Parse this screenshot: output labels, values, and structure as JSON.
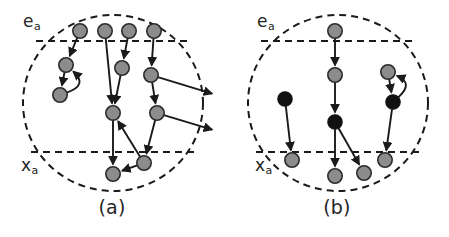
{
  "figure": {
    "title": "",
    "background_color": "#ffffff",
    "width": 449,
    "height": 237
  },
  "style": {
    "node_gray_fill": "#8c8c8c",
    "node_gray_stroke": "#2b2b2b",
    "node_black_fill": "#111111",
    "node_black_stroke": "#111111",
    "edge_color": "#1a1a1a",
    "boundary_color": "#1a1a1a",
    "band_color": "#1a1a1a",
    "text_color": "#252525",
    "node_radius": 7.2,
    "edge_width": 1.9,
    "boundary_dash": "7,5",
    "band_dash": "7,5"
  },
  "panels": [
    {
      "id": "a",
      "caption": "(a)",
      "top_label": "e",
      "top_label_sub": "a",
      "bottom_label": "x",
      "bottom_label_sub": "a",
      "boundary": {
        "cx": 113,
        "cy": 103,
        "rx": 90,
        "ry": 88
      },
      "bands": [
        {
          "name": "upper-band-line",
          "y": 41,
          "x1": 36,
          "x2": 191
        },
        {
          "name": "lower-band-line",
          "y": 152,
          "x1": 31,
          "x2": 196
        }
      ],
      "nodes": [
        {
          "id": "a1",
          "x": 80,
          "y": 31,
          "color": "gray"
        },
        {
          "id": "a2",
          "x": 105,
          "y": 31,
          "color": "gray"
        },
        {
          "id": "a3",
          "x": 129,
          "y": 31,
          "color": "gray"
        },
        {
          "id": "a4",
          "x": 154,
          "y": 31,
          "color": "gray"
        },
        {
          "id": "a5",
          "x": 66,
          "y": 65,
          "color": "gray"
        },
        {
          "id": "a6",
          "x": 122,
          "y": 68,
          "color": "gray"
        },
        {
          "id": "a7",
          "x": 151,
          "y": 75,
          "color": "gray"
        },
        {
          "id": "a8",
          "x": 60,
          "y": 95,
          "color": "gray"
        },
        {
          "id": "a9",
          "x": 113,
          "y": 113,
          "color": "gray"
        },
        {
          "id": "a10",
          "x": 157,
          "y": 113,
          "color": "gray"
        },
        {
          "id": "a11",
          "x": 144,
          "y": 163,
          "color": "gray"
        },
        {
          "id": "a12",
          "x": 113,
          "y": 174,
          "color": "gray"
        }
      ],
      "edges": [
        {
          "from": "a1",
          "to": "a5",
          "kind": "straight"
        },
        {
          "from": "a2",
          "to": "a9",
          "kind": "straight"
        },
        {
          "from": "a3",
          "to": "a6",
          "kind": "straight"
        },
        {
          "from": "a4",
          "to": "a7",
          "kind": "straight"
        },
        {
          "from": "a5",
          "to": "a8",
          "kind": "straight"
        },
        {
          "from": "a8",
          "to": "a5",
          "kind": "curved",
          "bow": 26
        },
        {
          "from": "a6",
          "to": "a9",
          "kind": "straight"
        },
        {
          "from": "a7",
          "to": "a10",
          "kind": "straight"
        },
        {
          "from": "a7",
          "to": "exit1",
          "kind": "exit"
        },
        {
          "from": "a10",
          "to": "exit2",
          "kind": "exit"
        },
        {
          "from": "a9",
          "to": "a12",
          "kind": "straight"
        },
        {
          "from": "a10",
          "to": "a11",
          "kind": "straight"
        },
        {
          "from": "a11",
          "to": "a9",
          "kind": "straight"
        },
        {
          "from": "a11",
          "to": "a12",
          "kind": "straight"
        }
      ],
      "exits": [
        {
          "id": "exit1",
          "x": 213,
          "y": 94
        },
        {
          "id": "exit2",
          "x": 213,
          "y": 130
        }
      ]
    },
    {
      "id": "b",
      "caption": "(b)",
      "top_label": "e",
      "top_label_sub": "a",
      "bottom_label": "x",
      "bottom_label_sub": "a",
      "boundary": {
        "cx": 113,
        "cy": 103,
        "rx": 90,
        "ry": 88
      },
      "bands": [
        {
          "name": "upper-band-line",
          "y": 41,
          "x1": 36,
          "x2": 191
        },
        {
          "name": "lower-band-line",
          "y": 152,
          "x1": 31,
          "x2": 196
        }
      ],
      "nodes": [
        {
          "id": "b1",
          "x": 110,
          "y": 31,
          "color": "gray"
        },
        {
          "id": "b2",
          "x": 110,
          "y": 75,
          "color": "gray"
        },
        {
          "id": "b3",
          "x": 163,
          "y": 72,
          "color": "gray"
        },
        {
          "id": "b4",
          "x": 60,
          "y": 99,
          "color": "black"
        },
        {
          "id": "b5",
          "x": 110,
          "y": 122,
          "color": "black"
        },
        {
          "id": "b6",
          "x": 168,
          "y": 102,
          "color": "black"
        },
        {
          "id": "b7",
          "x": 67,
          "y": 160,
          "color": "gray"
        },
        {
          "id": "b8",
          "x": 110,
          "y": 176,
          "color": "gray"
        },
        {
          "id": "b9",
          "x": 139,
          "y": 173,
          "color": "gray"
        },
        {
          "id": "b10",
          "x": 160,
          "y": 160,
          "color": "gray"
        }
      ],
      "edges": [
        {
          "from": "b1",
          "to": "b2",
          "kind": "straight"
        },
        {
          "from": "b2",
          "to": "b5",
          "kind": "straight"
        },
        {
          "from": "b3",
          "to": "b6",
          "kind": "straight"
        },
        {
          "from": "b6",
          "to": "b3",
          "kind": "curved",
          "bow": 24
        },
        {
          "from": "b4",
          "to": "b7",
          "kind": "straight"
        },
        {
          "from": "b5",
          "to": "b8",
          "kind": "straight"
        },
        {
          "from": "b5",
          "to": "b9",
          "kind": "straight"
        },
        {
          "from": "b6",
          "to": "b10",
          "kind": "straight"
        }
      ],
      "exits": []
    }
  ]
}
